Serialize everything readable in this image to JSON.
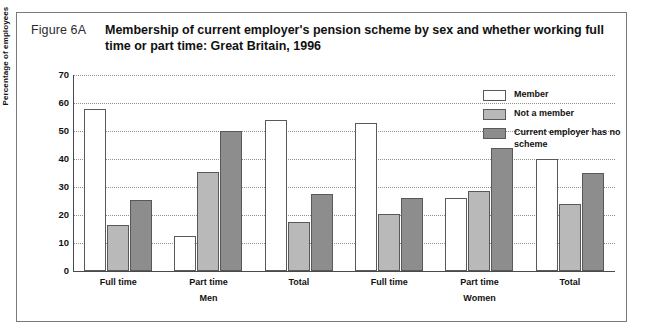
{
  "figure": {
    "number": "Figure 6A",
    "title": "Membership of current employer's pension scheme by sex and whether working full time or part time: Great Britain, 1996"
  },
  "legend": [
    {
      "label": "Member",
      "color": "#ffffff",
      "name": "member"
    },
    {
      "label": "Not a member",
      "color": "#b9b9b9",
      "name": "not-a-member"
    },
    {
      "label": "Current employer has no scheme",
      "color": "#8d8d8d",
      "name": "no-scheme"
    }
  ],
  "chart_data": {
    "type": "bar",
    "title": "Membership of current employer's pension scheme by sex and whether working full time or part time: Great Britain, 1996",
    "xlabel": "",
    "ylabel": "Percentage of employees",
    "ylim": [
      0,
      70
    ],
    "yticks": [
      0,
      10,
      20,
      30,
      40,
      50,
      60,
      70
    ],
    "grid": true,
    "legend_position": "top-right",
    "categories": [
      "Full time",
      "Part time",
      "Total",
      "Full time",
      "Part time",
      "Total"
    ],
    "group_labels": [
      "Men",
      "Women"
    ],
    "groups": [
      {
        "sex": "Men",
        "category": "Full time",
        "member": 58,
        "not_a_member": 16.5,
        "no_scheme": 25.5
      },
      {
        "sex": "Men",
        "category": "Part time",
        "member": 12.5,
        "not_a_member": 35.5,
        "no_scheme": 50
      },
      {
        "sex": "Men",
        "category": "Total",
        "member": 54,
        "not_a_member": 17.5,
        "no_scheme": 27.5
      },
      {
        "sex": "Women",
        "category": "Full time",
        "member": 53,
        "not_a_member": 20.5,
        "no_scheme": 26
      },
      {
        "sex": "Women",
        "category": "Part time",
        "member": 26,
        "not_a_member": 28.5,
        "no_scheme": 44
      },
      {
        "sex": "Women",
        "category": "Total",
        "member": 40,
        "not_a_member": 24,
        "no_scheme": 35
      }
    ],
    "series": [
      {
        "name": "Member",
        "values": [
          58,
          12.5,
          54,
          53,
          26,
          40
        ]
      },
      {
        "name": "Not a member",
        "values": [
          16.5,
          35.5,
          17.5,
          20.5,
          28.5,
          24
        ]
      },
      {
        "name": "Current employer has no scheme",
        "values": [
          25.5,
          50,
          27.5,
          26,
          44,
          35
        ]
      }
    ]
  }
}
